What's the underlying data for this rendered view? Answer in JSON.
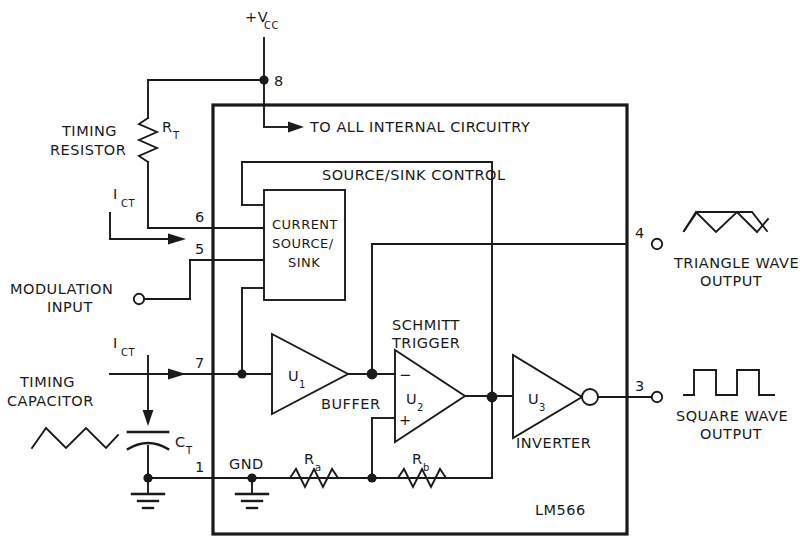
{
  "diagram": {
    "chip_label": "LM566"
  },
  "supply": {
    "label_main": "+V",
    "label_sub": "CC",
    "pin": "8",
    "internal_note": "TO ALL INTERNAL CIRCUITRY"
  },
  "left_components": {
    "timing_resistor_line1": "TIMING",
    "timing_resistor_line2": "RESISTOR",
    "rt_main": "R",
    "rt_sub": "T",
    "ict_top_main": "I",
    "ict_top_sub": "CT",
    "modulation_line1": "MODULATION",
    "modulation_line2": "INPUT",
    "ict_bottom_main": "I",
    "ict_bottom_sub": "CT",
    "timing_capacitor_line1": "TIMING",
    "timing_capacitor_line2": "CAPACITOR",
    "ct_main": "C",
    "ct_sub": "T"
  },
  "pins": {
    "p8": "8",
    "p6": "6",
    "p5": "5",
    "p7": "7",
    "p1": "1",
    "p4": "4",
    "p3": "3"
  },
  "blocks": {
    "current_source_line1": "CURRENT",
    "current_source_line2": "SOURCE/",
    "current_source_line3": "SINK",
    "source_sink_control": "SOURCE/SINK CONTROL",
    "schmitt_line1": "SCHMITT",
    "schmitt_line2": "TRIGGER",
    "buffer": "BUFFER",
    "inverter": "INVERTER",
    "u1_main": "U",
    "u1_sub": "1",
    "u2_main": "U",
    "u2_sub": "2",
    "u3_main": "U",
    "u3_sub": "3",
    "minus_sign": "−",
    "plus_sign": "+"
  },
  "resistors": {
    "ra_main": "R",
    "ra_sub": "a",
    "rb_main": "R",
    "rb_sub": "b"
  },
  "ground": {
    "label": "GND"
  },
  "outputs": {
    "triangle_line1": "TRIANGLE WAVE",
    "triangle_line2": "OUTPUT",
    "square_line1": "SQUARE WAVE",
    "square_line2": "OUTPUT"
  },
  "colors": {
    "ink": "#1a1a1a",
    "background": "#ffffff"
  }
}
